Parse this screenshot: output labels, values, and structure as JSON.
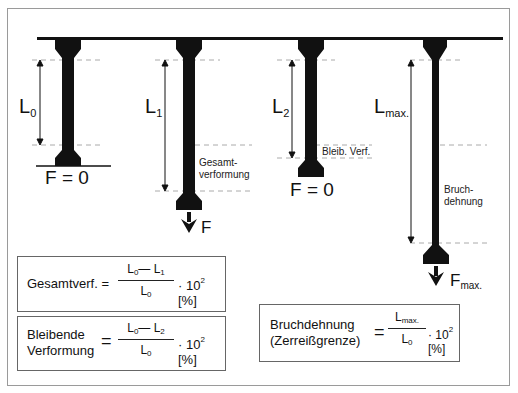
{
  "specimens": [
    {
      "length_label": "L",
      "length_sub": "0",
      "force_label": "F = 0",
      "note": ""
    },
    {
      "length_label": "L",
      "length_sub": "1",
      "force_label": "F",
      "force_sub": "",
      "note_line1": "Gesamt-",
      "note_line2": "verformung"
    },
    {
      "length_label": "L",
      "length_sub": "2",
      "force_label": "F = 0",
      "note": "Bleib. Verf."
    },
    {
      "length_label": "L",
      "length_sub": "max.",
      "force_label": "F",
      "force_sub": "max.",
      "note_line1": "Bruch-",
      "note_line2": "dehnung"
    }
  ],
  "formulas": [
    {
      "name_line1": "Gesamtverf. =",
      "name_line2": "",
      "eq": "",
      "num_a": "L",
      "num_a_sub": "0",
      "minus": "—",
      "num_b": "L",
      "num_b_sub": "1",
      "den": "L",
      "den_sub": "0",
      "mult": "·  10",
      "exp": "2",
      "unit": " [%]"
    },
    {
      "name_line1": "Bleibende",
      "name_line2": "Verformung",
      "eq": "=",
      "num_a": "L",
      "num_a_sub": "0",
      "minus": "—",
      "num_b": "L",
      "num_b_sub": "2",
      "den": "L",
      "den_sub": "0",
      "mult": "·  10",
      "exp": "2",
      "unit": " [%]"
    },
    {
      "name_line1": "Bruchdehnung",
      "name_line2": "(Zerreißgrenze)",
      "eq": "=",
      "num_a": "L",
      "num_a_sub": "max.",
      "den": "L",
      "den_sub": "0",
      "mult": "·  10",
      "exp": "2",
      "unit": " [%]"
    }
  ]
}
